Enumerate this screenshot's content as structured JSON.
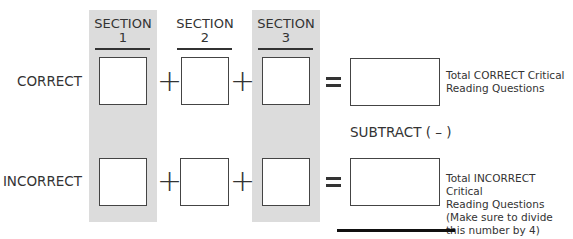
{
  "sections": [
    {
      "title": "SECTION",
      "number": "1",
      "shaded": true
    },
    {
      "title": "SECTION",
      "number": "2",
      "shaded": false
    },
    {
      "title": "SECTION",
      "number": "3",
      "shaded": true
    }
  ],
  "rows": {
    "correct": {
      "label": "CORRECT",
      "note": "Total CORRECT Critical\nReading Questions"
    },
    "incorrect": {
      "label": "INCORRECT",
      "note": "Total INCORRECT Critical\nReading Questions\n(Make sure to divide\nthis number by 4)"
    }
  },
  "operators": {
    "plus": "+",
    "equals": "="
  },
  "subtract_label": "SUBTRACT ( – )",
  "colors": {
    "shade": "#dcdcdc",
    "ink": "#333333"
  }
}
